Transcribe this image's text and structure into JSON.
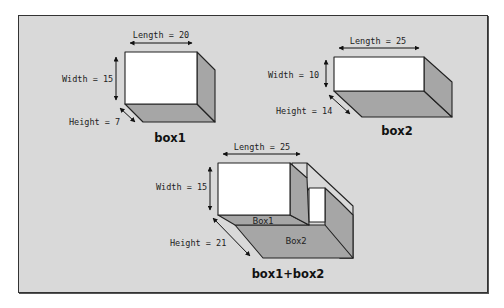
{
  "diagram": {
    "colors": {
      "background": "#d9d9d9",
      "front_face": "#ffffff",
      "side_face": "#a6a6a6",
      "bottom_face": "#a6a6a6",
      "stroke": "#222222"
    },
    "box1": {
      "caption": "box1",
      "length_label": "Length = 20",
      "width_label": "Width = 15",
      "height_label": "Height = 7"
    },
    "box2": {
      "caption": "box2",
      "length_label": "Length = 25",
      "width_label": "Width = 10",
      "height_label": "Height = 14"
    },
    "combined": {
      "caption": "box1+box2",
      "length_label": "Length = 25",
      "width_label": "Width = 15",
      "height_label": "Height = 21",
      "inner_labels": [
        "Box1",
        "Box2"
      ]
    }
  }
}
